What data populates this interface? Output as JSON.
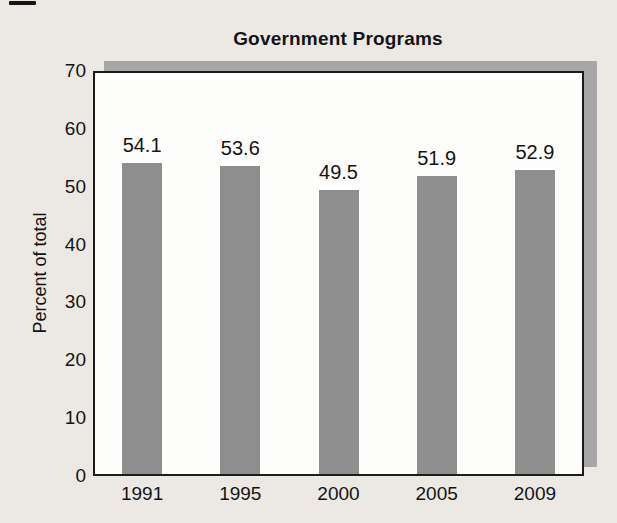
{
  "figure": {
    "background_color": "#ece9e5",
    "text_color": "#141414"
  },
  "chart_data": {
    "type": "bar",
    "title": "Government Programs",
    "categories": [
      "1991",
      "1995",
      "2000",
      "2005",
      "2009"
    ],
    "values": [
      54.1,
      53.6,
      49.5,
      51.9,
      52.9
    ],
    "value_labels": [
      "54.1",
      "53.6",
      "49.5",
      "51.9",
      "52.9"
    ],
    "xlabel": "",
    "ylabel": "Percent of total",
    "ylim": [
      0,
      70
    ],
    "yticks": [
      0,
      10,
      20,
      30,
      40,
      50,
      60,
      70
    ],
    "grid": false,
    "legend": "none",
    "bar_color": "#8e8e8e",
    "shadow_color": "#a7a7a7",
    "plot_bg_color": "#fdfdfb",
    "border_color": "#1c1c1c"
  }
}
